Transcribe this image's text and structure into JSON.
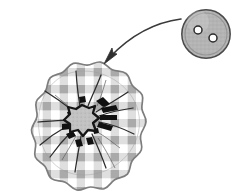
{
  "canvas": {
    "width": 251,
    "height": 192,
    "background_color": "#ffffff"
  },
  "illustration": {
    "title": "Gingham fabric yo-yo rosette with button",
    "description": "A curved arrow points from a two-hole round button down to a gathered gingham fabric circle"
  },
  "fabric_rosette": {
    "name": "gingham-fabric-circle",
    "center_x": 84,
    "center_y": 122,
    "radius": 62,
    "scallop_count": 13,
    "scallop_depth": 4,
    "outline_color": "#7d7d7d",
    "outline_width": 1.6,
    "gathered_center": {
      "name": "gathered-center-opening",
      "fill_color": "#c2c2c2",
      "outline_color": "#1a1a1a",
      "outline_width": 2.4,
      "center_x": 82,
      "center_y": 120,
      "radius": 15
    },
    "gather_lines": {
      "count": 11,
      "color": "#2a2a2a",
      "width": 1.2
    },
    "stitch_marks": {
      "count": 9,
      "color": "#111111"
    }
  },
  "gingham": {
    "name": "gingham-check-pattern",
    "cell_size": 8.5,
    "light_color": "#ffffff",
    "mid_color": "#dedede",
    "dark_color": "#a6a6a6",
    "opacity": 0.95
  },
  "button": {
    "name": "two-hole-button",
    "center_x": 206,
    "center_y": 34,
    "radius": 24.5,
    "body_color": "#b4b4b4",
    "rim_color": "#f0f0f0",
    "outline_color": "#4a4a4a",
    "outline_width": 1.4,
    "inner_ring_radius": 21,
    "inner_ring_color": "#8e8e8e",
    "holes": [
      {
        "label": "hole-upper-left",
        "cx": 198,
        "cy": 30,
        "r": 4.0,
        "fill": "#ffffff",
        "stroke": "#2b2b2b"
      },
      {
        "label": "hole-lower-right",
        "cx": 213,
        "cy": 38,
        "r": 4.0,
        "fill": "#ffffff",
        "stroke": "#2b2b2b"
      }
    ]
  },
  "arrow": {
    "name": "pointer-arrow",
    "color": "#3a3a3a",
    "stroke_width": 1.5,
    "start_x": 181,
    "start_y": 19,
    "control_x": 148,
    "control_y": 28,
    "end_x": 109,
    "end_y": 57,
    "head_tip_x": 104,
    "head_tip_y": 63,
    "head_length": 11,
    "head_width": 7
  }
}
